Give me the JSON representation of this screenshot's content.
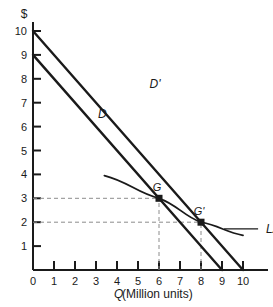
{
  "chart_data": {
    "type": "line",
    "title": "",
    "xlabel": "Q (Million units)",
    "xlabel_italic_part": "Q",
    "xlabel_plain_part": " (Million units)",
    "ylabel": "$",
    "xlim": [
      0,
      10
    ],
    "ylim": [
      0,
      10
    ],
    "grid": false,
    "legend": "none",
    "x_ticks": [
      "0",
      "1",
      "2",
      "3",
      "4",
      "5",
      "6",
      "7",
      "8",
      "9",
      "10"
    ],
    "y_ticks": [
      "1",
      "2",
      "3",
      "4",
      "5",
      "6",
      "7",
      "8",
      "9",
      "10"
    ],
    "series": [
      {
        "name": "D",
        "label": "D",
        "type": "line",
        "points": [
          [
            0,
            9
          ],
          [
            9,
            0
          ]
        ],
        "label_x": 3.1,
        "label_y": 6.35
      },
      {
        "name": "D'",
        "label": "D'",
        "type": "line",
        "points": [
          [
            0,
            10
          ],
          [
            10,
            0
          ]
        ],
        "label_x": 5.55,
        "label_y": 7.6
      },
      {
        "name": "LAC",
        "label": "LAC",
        "type": "curve",
        "points": [
          [
            3.4,
            3.95
          ],
          [
            6,
            3
          ],
          [
            8,
            2
          ],
          [
            10,
            1.45
          ]
        ],
        "label_x": 11.1,
        "label_y": 1.55
      }
    ],
    "points": [
      {
        "name": "G",
        "label": "G",
        "x": 6,
        "y": 3
      },
      {
        "name": "G-prime",
        "label": "G'",
        "x": 8,
        "y": 2
      }
    ],
    "guides": [
      {
        "name": "price-3-guide",
        "from": [
          0,
          3
        ],
        "to": [
          6,
          3
        ],
        "style": "dashed"
      },
      {
        "name": "quantity-6-guide",
        "from": [
          6,
          0
        ],
        "to": [
          6,
          3
        ],
        "style": "dashed"
      },
      {
        "name": "price-2-guide",
        "from": [
          0,
          2
        ],
        "to": [
          8,
          2
        ],
        "style": "dashed"
      },
      {
        "name": "quantity-8-guide",
        "from": [
          8,
          0
        ],
        "to": [
          8,
          2
        ],
        "style": "dashed"
      }
    ],
    "colors": {
      "line": "#1a1a1a",
      "axis": "#1a1a1a",
      "guide": "#8c8c8c",
      "background": "#ffffff"
    }
  }
}
